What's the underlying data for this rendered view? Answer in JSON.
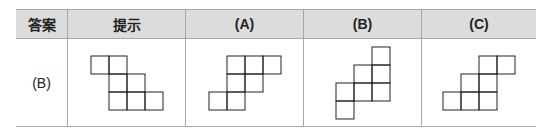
{
  "table": {
    "headers": [
      "答案",
      "提示",
      "(A)",
      "(B)",
      "(C)"
    ],
    "answer": "(B)",
    "cell_size": 18,
    "figures": {
      "hint": {
        "grid": [
          [
            0,
            0
          ],
          [
            1,
            0
          ],
          [
            1,
            1
          ],
          [
            2,
            1
          ],
          [
            1,
            2
          ],
          [
            2,
            2
          ],
          [
            3,
            2
          ]
        ],
        "cols": 4,
        "rows": 3
      },
      "A": {
        "grid": [
          [
            1,
            0
          ],
          [
            2,
            0
          ],
          [
            3,
            0
          ],
          [
            1,
            1
          ],
          [
            2,
            1
          ],
          [
            0,
            2
          ],
          [
            1,
            2
          ]
        ],
        "cols": 4,
        "rows": 3
      },
      "B": {
        "grid": [
          [
            2,
            0
          ],
          [
            1,
            1
          ],
          [
            2,
            1
          ],
          [
            0,
            2
          ],
          [
            1,
            2
          ],
          [
            2,
            2
          ],
          [
            0,
            3
          ]
        ],
        "cols": 3,
        "rows": 4
      },
      "C": {
        "grid": [
          [
            2,
            0
          ],
          [
            3,
            0
          ],
          [
            1,
            1
          ],
          [
            2,
            1
          ],
          [
            0,
            2
          ],
          [
            1,
            2
          ],
          [
            2,
            2
          ]
        ],
        "cols": 4,
        "rows": 3
      }
    }
  }
}
